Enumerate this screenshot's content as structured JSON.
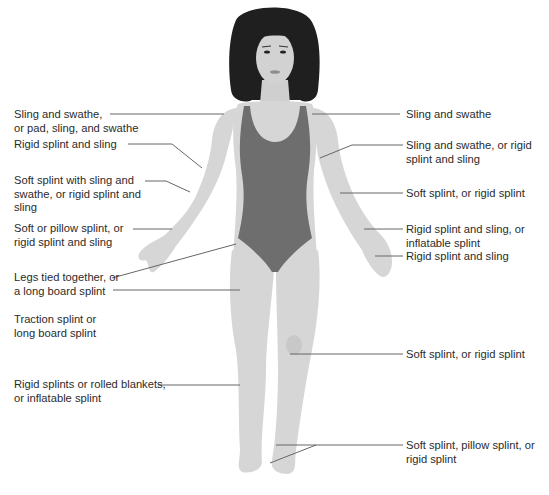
{
  "diagram": {
    "colors": {
      "background": "#ffffff",
      "skin": "#d6d6d6",
      "skin_shadow": "#c4c4c4",
      "swimsuit": "#6e6e6e",
      "hair": "#1f1f1f",
      "leader_line": "#666666",
      "text": "#2b2b2b"
    },
    "left_labels": [
      {
        "id": "shoulder-left",
        "text": "Sling and swathe,\nor pad, sling, and swathe"
      },
      {
        "id": "upper-arm-left",
        "text": "Rigid splint and sling"
      },
      {
        "id": "elbow-left",
        "text": "Soft splint with sling and\nswathe, or rigid splint and\nsling"
      },
      {
        "id": "forearm-left",
        "text": "Soft or pillow splint, or\nrigid splint and sling"
      },
      {
        "id": "pelvis",
        "text": "Legs tied together, or\na long board splint"
      },
      {
        "id": "femur",
        "text": "Traction splint or\nlong board splint"
      },
      {
        "id": "lower-leg",
        "text": "Rigid splints or rolled blankets,\nor inflatable splint"
      }
    ],
    "right_labels": [
      {
        "id": "clavicle-right",
        "text": "Sling and swathe"
      },
      {
        "id": "humerus-right",
        "text": "Sling and swathe, or rigid\nsplint and sling"
      },
      {
        "id": "elbow-right",
        "text": "Soft splint, or rigid splint"
      },
      {
        "id": "wrist-right",
        "text": "Rigid splint and sling, or\ninflatable splint"
      },
      {
        "id": "hand-right",
        "text": "Rigid splint and sling"
      },
      {
        "id": "knee-right",
        "text": "Soft splint, or rigid splint"
      },
      {
        "id": "ankle-foot-right",
        "text": "Soft splint, pillow splint, or\nrigid splint"
      }
    ]
  }
}
